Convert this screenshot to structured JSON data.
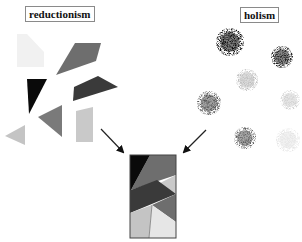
{
  "labels": {
    "left": "reductionism",
    "right": "holism"
  },
  "colors": {
    "black": "#0a0a0a",
    "dark": "#3a3a3a",
    "gray": "#6e6e6e",
    "light": "#c4c4c4",
    "very_light": "#e6e6e6",
    "faint": "#f2f2f2",
    "arrow": "#222222"
  },
  "reductionism_shapes": [
    {
      "name": "faint-pentagon",
      "points": "17,34 27,34 44,52 44,67 17,67",
      "fill": "#f1f1f1"
    },
    {
      "name": "gray-quadrilateral",
      "points": "56,75 75,43 101,43 96,61",
      "fill": "#6e6e6e"
    },
    {
      "name": "black-triangle",
      "points": "27,79 47,79 29,114",
      "fill": "#0a0a0a"
    },
    {
      "name": "dark-parallelogram",
      "points": "74,87 98,76 118,87 73,101",
      "fill": "#3a3a3a"
    },
    {
      "name": "gray-triangle",
      "points": "38,117 62,105 62,137",
      "fill": "#7a7a7a"
    },
    {
      "name": "light-quadrilateral",
      "points": "76,111 93,107 93,142 76,142",
      "fill": "#c9c9c9"
    },
    {
      "name": "light-triangle",
      "points": "5,136 25,125 25,145",
      "fill": "#c4c4c4"
    }
  ],
  "holism_blobs": [
    {
      "name": "darkest-blob",
      "cx": 230,
      "cy": 42,
      "r": 14,
      "shade": "#101010"
    },
    {
      "name": "dark-blob",
      "cx": 282,
      "cy": 57,
      "r": 11,
      "shade": "#242424"
    },
    {
      "name": "light-blob",
      "cx": 247,
      "cy": 80,
      "r": 11,
      "shade": "#bdbdbd"
    },
    {
      "name": "medium-blob",
      "cx": 209,
      "cy": 103,
      "r": 12,
      "shade": "#555555"
    },
    {
      "name": "very-light-blob",
      "cx": 290,
      "cy": 100,
      "r": 10,
      "shade": "#d2d2d2"
    },
    {
      "name": "medium-gray-blob",
      "cx": 245,
      "cy": 138,
      "r": 11,
      "shade": "#5e5e5e"
    },
    {
      "name": "faint-blob",
      "cx": 288,
      "cy": 140,
      "r": 12,
      "shade": "#e6e6e6"
    }
  ],
  "arrows": [
    {
      "name": "left-arrow",
      "x1": 101,
      "y1": 129,
      "x2": 123,
      "y2": 152
    },
    {
      "name": "right-arrow",
      "x1": 206,
      "y1": 130,
      "x2": 184,
      "y2": 152
    }
  ],
  "composite": {
    "x": 130,
    "y": 155,
    "width": 46,
    "height": 83,
    "pieces": [
      {
        "name": "composite-gray-top",
        "points": "150,155 176,155 176,175 131,190",
        "fill": "#6e6e6e"
      },
      {
        "name": "composite-black",
        "points": "130,155 150,155 131,190 130,190",
        "fill": "#0a0a0a"
      },
      {
        "name": "composite-light-wedge",
        "points": "176,175 176,194 158,184",
        "fill": "#c9c9c9"
      },
      {
        "name": "composite-dark-band",
        "points": "130,190 131,190 157,180 176,194 130,213",
        "fill": "#3a3a3a"
      },
      {
        "name": "composite-gray-lower",
        "points": "152,205 176,194 176,222",
        "fill": "#6e6e6e"
      },
      {
        "name": "composite-light-left",
        "points": "130,213 152,205 149,238 130,238",
        "fill": "#c4c4c4"
      },
      {
        "name": "composite-very-light-right",
        "points": "152,205 176,222 176,238 149,238",
        "fill": "#e6e6e6"
      }
    ]
  }
}
